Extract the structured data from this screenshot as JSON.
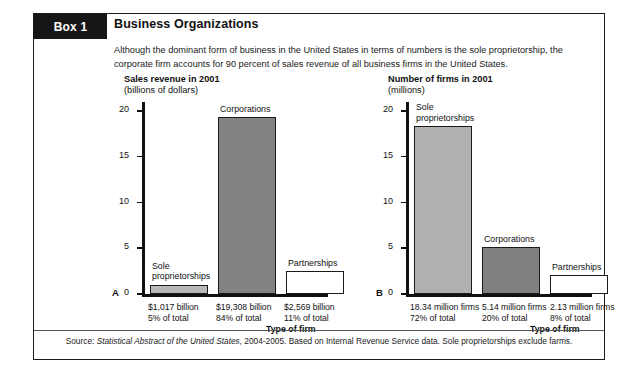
{
  "box": {
    "tab_label": "Box 1",
    "title": "Business Organizations",
    "intro": "Although the dominant form of business in the United States in terms of numbers is the sole proprietorship, the corporate firm accounts for 90 percent of sales revenue of all business firms in the United States.",
    "source_prefix": "Source: ",
    "source_italic": "Statistical Abstract of the United States,",
    "source_rest": " 2004-2005. Based on Internal Revenue Service data. Sole proprietorships exclude farms.",
    "border_color": "#1a1a1a",
    "tab_bg": "#161616"
  },
  "chart_data": [
    {
      "panel": "A",
      "type": "bar",
      "title": "Sales revenue in 2001",
      "subtitle": "(billions of dollars)",
      "xlabel": "Type of firm",
      "ylabel": "",
      "ylim": [
        0,
        21
      ],
      "yticks": [
        0,
        5,
        10,
        15,
        20
      ],
      "ytick_labels": [
        "0",
        "5",
        "10",
        "15",
        "20"
      ],
      "grid": false,
      "categories": [
        "Sole\nproprietorships",
        "Corporations",
        "Partnerships"
      ],
      "values": [
        1.017,
        19.308,
        2.569
      ],
      "value_unit": "trillions of dollars (axis in thousands of billions)",
      "bar_colors": [
        "#b8b8b8",
        "#828282",
        "#ffffff"
      ],
      "captions": [
        "$1,017 billion\n5% of total",
        "$19,308 billion\n84% of total",
        "$2,569 billion\n11% of total"
      ]
    },
    {
      "panel": "B",
      "type": "bar",
      "title": "Number of firms in 2001",
      "subtitle": "(millions)",
      "xlabel": "Type of firm",
      "ylabel": "",
      "ylim": [
        0,
        21
      ],
      "yticks": [
        0,
        5,
        10,
        15,
        20
      ],
      "ytick_labels": [
        "0",
        "5",
        "10",
        "15",
        "20"
      ],
      "grid": false,
      "categories": [
        "Sole\nproprietorships",
        "Corporations",
        "Partnerships"
      ],
      "values": [
        18.34,
        5.14,
        2.13
      ],
      "value_unit": "millions of firms",
      "bar_colors": [
        "#b0b0b0",
        "#808080",
        "#ffffff"
      ],
      "captions": [
        "18.34 million firms\n72% of total",
        "5.14 million firms\n20% of total",
        "2.13 million firms\n8% of total"
      ]
    }
  ]
}
